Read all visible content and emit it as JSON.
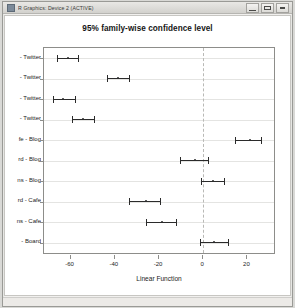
{
  "window": {
    "title": "R Graphics: Device 2 (ACTIVE)",
    "icon": "r-graphics-icon",
    "buttons": {
      "minimize": "minimize-button",
      "maximize": "maximize-button",
      "close": "close-button"
    }
  },
  "chart_data": {
    "type": "scatter",
    "title": "95% family-wise confidence level",
    "xlabel": "Linear Function",
    "ylabel": "",
    "xlim": [
      -72,
      32
    ],
    "xticks": [
      -60,
      -40,
      -20,
      0,
      20
    ],
    "xticklabels": [
      "-60",
      "-40",
      "-20",
      "0",
      "20"
    ],
    "grid": true,
    "reference_line": 0,
    "categories": [
      "- Twitter",
      "- Twitter",
      "- Twitter",
      "- Twitter",
      "fe - Blog",
      "rd - Blog",
      "ns - Blog",
      "rd - Cafe",
      "ns - Cafe",
      "- Board"
    ],
    "estimates": [
      -61.0,
      -38.5,
      -63.5,
      -54.5,
      21.0,
      -3.5,
      4.5,
      -26.0,
      -18.5,
      5.0
    ],
    "ci_lower": [
      -66.0,
      -43.5,
      -68.0,
      -59.5,
      14.5,
      -10.5,
      -1.0,
      -33.5,
      -26.0,
      -1.5
    ],
    "ci_upper": [
      -56.0,
      -33.0,
      -57.5,
      -49.0,
      26.5,
      2.5,
      10.0,
      -19.0,
      -12.0,
      11.5
    ]
  }
}
